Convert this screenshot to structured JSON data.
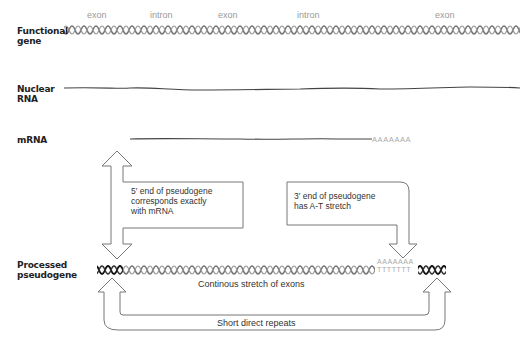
{
  "rows": {
    "functional_gene": {
      "label_line1": "Functional",
      "label_line2": "gene"
    },
    "nuclear_rna": {
      "label_line1": "Nuclear",
      "label_line2": "RNA"
    },
    "mrna": {
      "label": "mRNA",
      "poly_a": "AAAAAAA"
    },
    "processed_pseudogene": {
      "label_line1": "Processed",
      "label_line2": "pseudogene",
      "poly_a_top": "AAAAAAA",
      "poly_t_bottom": "TTTTTTT"
    }
  },
  "gene_segments": [
    {
      "label": "exon"
    },
    {
      "label": "intron"
    },
    {
      "label": "exon"
    },
    {
      "label": "intron"
    },
    {
      "label": "exon"
    }
  ],
  "annotations": {
    "five_prime_line1": "5′ end of pseudogene",
    "five_prime_line2": "corresponds exactly",
    "five_prime_line3": "with mRNA",
    "three_prime_line1": "3′ end of pseudogene",
    "three_prime_line2": "has A-T stretch",
    "continuous_stretch": "Continous stretch of exons",
    "short_repeats": "Short direct repeats"
  },
  "colors": {
    "helix_gray": "#777777",
    "helix_dark": "#222222",
    "label_gray": "#999999",
    "arrow_outline": "#777777"
  }
}
